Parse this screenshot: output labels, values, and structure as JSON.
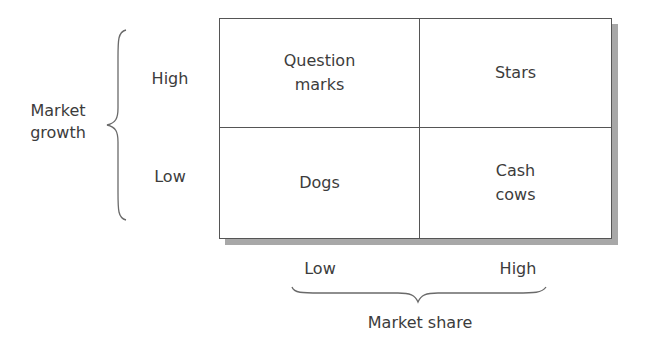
{
  "y_axis": {
    "label": "Market\ngrowth",
    "high": "High",
    "low": "Low"
  },
  "x_axis": {
    "label": "Market share",
    "low": "Low",
    "high": "High"
  },
  "quadrants": {
    "top_left": "Question\nmarks",
    "top_right": "Stars",
    "bottom_left": "Dogs",
    "bottom_right": "Cash\ncows"
  },
  "colors": {
    "line": "#555555",
    "shadow": "#a8a8a8",
    "text": "#3c3c3c"
  }
}
